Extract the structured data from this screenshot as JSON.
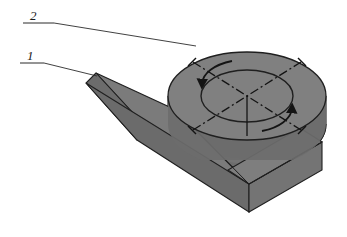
{
  "figure": {
    "background_color": "#ffffff",
    "width": 347,
    "height": 237
  },
  "callouts": [
    {
      "id": "callout-2",
      "label": "2",
      "refers_to": "cylindrical-boss",
      "text_x": 30,
      "text_y": 20,
      "shelf": "M 23 23 L 54 23",
      "leader": "M 54 23 L 196 46"
    },
    {
      "id": "callout-1",
      "label": "1",
      "refers_to": "rectangular-bar",
      "text_x": 27,
      "text_y": 60,
      "shelf": "M 20 63 L 44 63",
      "leader": "M 44 63 L 97 76"
    }
  ],
  "parts": {
    "rectangular_bar": {
      "name": "rectangular-bar",
      "callout": "1",
      "top_face": {
        "points": "96,73 176,110 249,184 145,126",
        "fill": "#7b7b7b"
      },
      "front_face": {
        "points": "96,73 86,83 137,140 145,126",
        "fill": "#6c6c6c"
      },
      "left_end_face": {
        "points": "86,83 137,140 249,212 249,184",
        "fill": "#6b6b6b"
      }
    },
    "cylinder": {
      "name": "cylindrical-boss",
      "callout": "2",
      "center_x": 247,
      "center_y": 96,
      "outer_rx": 79,
      "outer_ry": 44,
      "inner_rx": 46,
      "inner_ry": 26,
      "height": 52,
      "top_fill": "#808080",
      "wall_fill": "#6d6d6d"
    }
  },
  "annotations": {
    "centerline_style": "dash-dot",
    "centerlines": [
      {
        "name": "centerline-diagonal-a",
        "from_angle": 205,
        "to_angle": 25
      },
      {
        "name": "centerline-diagonal-b",
        "from_angle": 335,
        "to_angle": 155
      }
    ],
    "axis_line": {
      "name": "vertical-axis-line",
      "x": 247,
      "y1": 96,
      "y2": 136
    },
    "rotation_arrows": [
      {
        "name": "rotation-arc-upper-left"
      },
      {
        "name": "rotation-arc-lower-right"
      }
    ]
  },
  "colors": {
    "outline": "#1f1f1f",
    "bar_top": "#7b7b7b",
    "bar_front": "#6c6c6c",
    "bar_end": "#6b6b6b",
    "cylinder_top": "#808080",
    "cylinder_wall": "#6d6d6d",
    "leader": "#2b2b2b",
    "centerline": "#141414"
  }
}
